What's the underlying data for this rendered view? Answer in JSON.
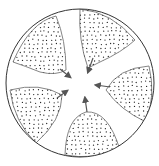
{
  "diagram": {
    "type": "radial-lobes",
    "colors": {
      "background": "#ffffff",
      "outline": "#333333",
      "lobe_outline": "#777777",
      "dots": "#222222",
      "arrow": "#555555"
    },
    "outer_circle": {
      "cx": 80,
      "cy": 83,
      "r": 74
    },
    "lobes": [
      {
        "id": "upper-left",
        "path": "M13,62 Q30,22 56,16 Q66,40 66,70 Q56,76 40,72 Q25,66 13,62 Z",
        "arrow": [
          60,
          69,
          70,
          77
        ]
      },
      {
        "id": "upper-right",
        "path": "M80,9 Q112,12 135,40 Q122,52 100,62 Q92,66 88,68 Q78,40 80,9 Z",
        "arrow": [
          93,
          58,
          88,
          72
        ]
      },
      {
        "id": "right",
        "path": "M149,66 Q156,95 146,122 Q120,110 106,90 Q118,68 149,66 Z",
        "arrow": [
          110,
          87,
          96,
          85
        ]
      },
      {
        "id": "bottom",
        "path": "M65,155 Q66,118 86,112 Q108,110 120,150 Q92,160 65,155 Z",
        "arrow": [
          87,
          112,
          85,
          98
        ]
      },
      {
        "id": "left",
        "path": "M10,90 Q40,82 62,95 Q62,120 36,143 Q14,122 10,90 Z",
        "arrow": [
          57,
          98,
          67,
          91
        ]
      }
    ],
    "center_label": ""
  }
}
